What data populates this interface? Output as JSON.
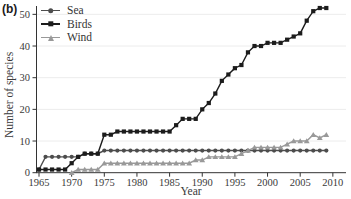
{
  "panel_label": "(b)",
  "colors": {
    "sea": "#4d4d4d",
    "birds": "#1c1c1c",
    "wind": "#999999",
    "axis": "#333333",
    "grid": "#ececec",
    "text": "#3a3a3a",
    "background": "#ffffff"
  },
  "chart_data": {
    "type": "line",
    "title": "",
    "xlabel": "Year",
    "ylabel": "Number of species",
    "legend_position": "top-left",
    "grid": true,
    "xticks": [
      1965,
      1970,
      1975,
      1980,
      1985,
      1990,
      1995,
      2000,
      2005,
      2010
    ],
    "yticks": [
      0,
      10,
      20,
      30,
      40,
      50
    ],
    "xlim": [
      1964,
      2012
    ],
    "ylim": [
      0,
      53
    ],
    "x": [
      1965,
      1966,
      1967,
      1968,
      1969,
      1970,
      1971,
      1972,
      1973,
      1974,
      1975,
      1976,
      1977,
      1978,
      1979,
      1980,
      1981,
      1982,
      1983,
      1984,
      1985,
      1986,
      1987,
      1988,
      1989,
      1990,
      1991,
      1992,
      1993,
      1994,
      1995,
      1996,
      1997,
      1998,
      1999,
      2000,
      2001,
      2002,
      2003,
      2004,
      2005,
      2006,
      2007,
      2008,
      2009
    ],
    "series": [
      {
        "name": "Sea",
        "marker": "circle",
        "color": "#4d4d4d",
        "values": [
          1,
          5,
          5,
          5,
          5,
          5,
          5,
          6,
          6,
          6,
          7,
          7,
          7,
          7,
          7,
          7,
          7,
          7,
          7,
          7,
          7,
          7,
          7,
          7,
          7,
          7,
          7,
          7,
          7,
          7,
          7,
          7,
          7,
          7,
          7,
          7,
          7,
          7,
          7,
          7,
          7,
          7,
          7,
          7,
          7
        ]
      },
      {
        "name": "Birds",
        "marker": "square",
        "color": "#1c1c1c",
        "values": [
          1,
          1,
          1,
          1,
          1,
          3,
          5,
          6,
          6,
          6,
          12,
          12,
          13,
          13,
          13,
          13,
          13,
          13,
          13,
          13,
          13,
          15,
          17,
          17,
          17,
          20,
          22,
          25,
          29,
          31,
          33,
          34,
          38,
          40,
          40,
          41,
          41,
          41,
          42,
          43,
          44,
          48,
          51,
          52,
          52
        ]
      },
      {
        "name": "Wind",
        "marker": "triangle",
        "color": "#999999",
        "values": [
          null,
          null,
          null,
          null,
          null,
          0,
          1,
          1,
          1,
          1,
          3,
          3,
          3,
          3,
          3,
          3,
          3,
          3,
          3,
          3,
          3,
          3,
          3,
          3,
          4,
          4,
          5,
          5,
          5,
          5,
          5,
          6,
          7,
          8,
          8,
          8,
          8,
          8,
          9,
          10,
          10,
          10,
          12,
          11,
          12
        ]
      }
    ]
  }
}
